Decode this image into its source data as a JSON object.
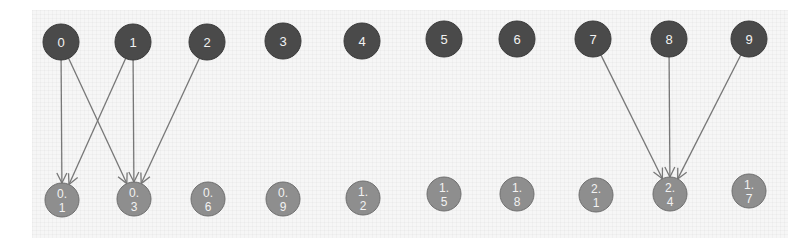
{
  "diagram": {
    "type": "bipartite-graph",
    "colors": {
      "top_node_fill": "#4a4a4a",
      "top_node_stroke": "#3a3a3a",
      "bottom_node_fill": "#8e8e8e",
      "bottom_node_stroke": "#6f6f6f",
      "edge": "#777777",
      "label": "#f2f2f2",
      "background": "#f6f6f6"
    },
    "top_nodes": [
      {
        "id": "t0",
        "label": "0",
        "x": 61,
        "y": 42
      },
      {
        "id": "t1",
        "label": "1",
        "x": 133,
        "y": 42
      },
      {
        "id": "t2",
        "label": "2",
        "x": 207,
        "y": 42
      },
      {
        "id": "t3",
        "label": "3",
        "x": 283,
        "y": 41
      },
      {
        "id": "t4",
        "label": "4",
        "x": 362,
        "y": 41
      },
      {
        "id": "t5",
        "label": "5",
        "x": 444,
        "y": 39
      },
      {
        "id": "t6",
        "label": "6",
        "x": 517,
        "y": 39
      },
      {
        "id": "t7",
        "label": "7",
        "x": 593,
        "y": 39
      },
      {
        "id": "t8",
        "label": "8",
        "x": 669,
        "y": 39
      },
      {
        "id": "t9",
        "label": "9",
        "x": 749,
        "y": 39
      }
    ],
    "bottom_nodes": [
      {
        "id": "b0",
        "line1": "0.",
        "line2": "1",
        "x": 62,
        "y": 200
      },
      {
        "id": "b1",
        "line1": "0.",
        "line2": "3",
        "x": 134,
        "y": 199
      },
      {
        "id": "b2",
        "line1": "0.",
        "line2": "6",
        "x": 208,
        "y": 199
      },
      {
        "id": "b3",
        "line1": "0.",
        "line2": "9",
        "x": 283,
        "y": 199
      },
      {
        "id": "b4",
        "line1": "1.",
        "line2": "2",
        "x": 363,
        "y": 198
      },
      {
        "id": "b5",
        "line1": "1.",
        "line2": "5",
        "x": 444,
        "y": 194
      },
      {
        "id": "b6",
        "line1": "1.",
        "line2": "8",
        "x": 517,
        "y": 194
      },
      {
        "id": "b7",
        "line1": "2.",
        "line2": "1",
        "x": 596,
        "y": 195
      },
      {
        "id": "b8",
        "line1": "2.",
        "line2": "4",
        "x": 670,
        "y": 194
      },
      {
        "id": "b9",
        "line1": "1.",
        "line2": "7",
        "x": 749,
        "y": 191
      }
    ],
    "edges": [
      {
        "from": "t0",
        "to": "b0"
      },
      {
        "from": "t0",
        "to": "b1"
      },
      {
        "from": "t1",
        "to": "b0"
      },
      {
        "from": "t1",
        "to": "b1"
      },
      {
        "from": "t2",
        "to": "b1"
      },
      {
        "from": "t7",
        "to": "b8"
      },
      {
        "from": "t8",
        "to": "b8"
      },
      {
        "from": "t9",
        "to": "b8"
      }
    ]
  }
}
